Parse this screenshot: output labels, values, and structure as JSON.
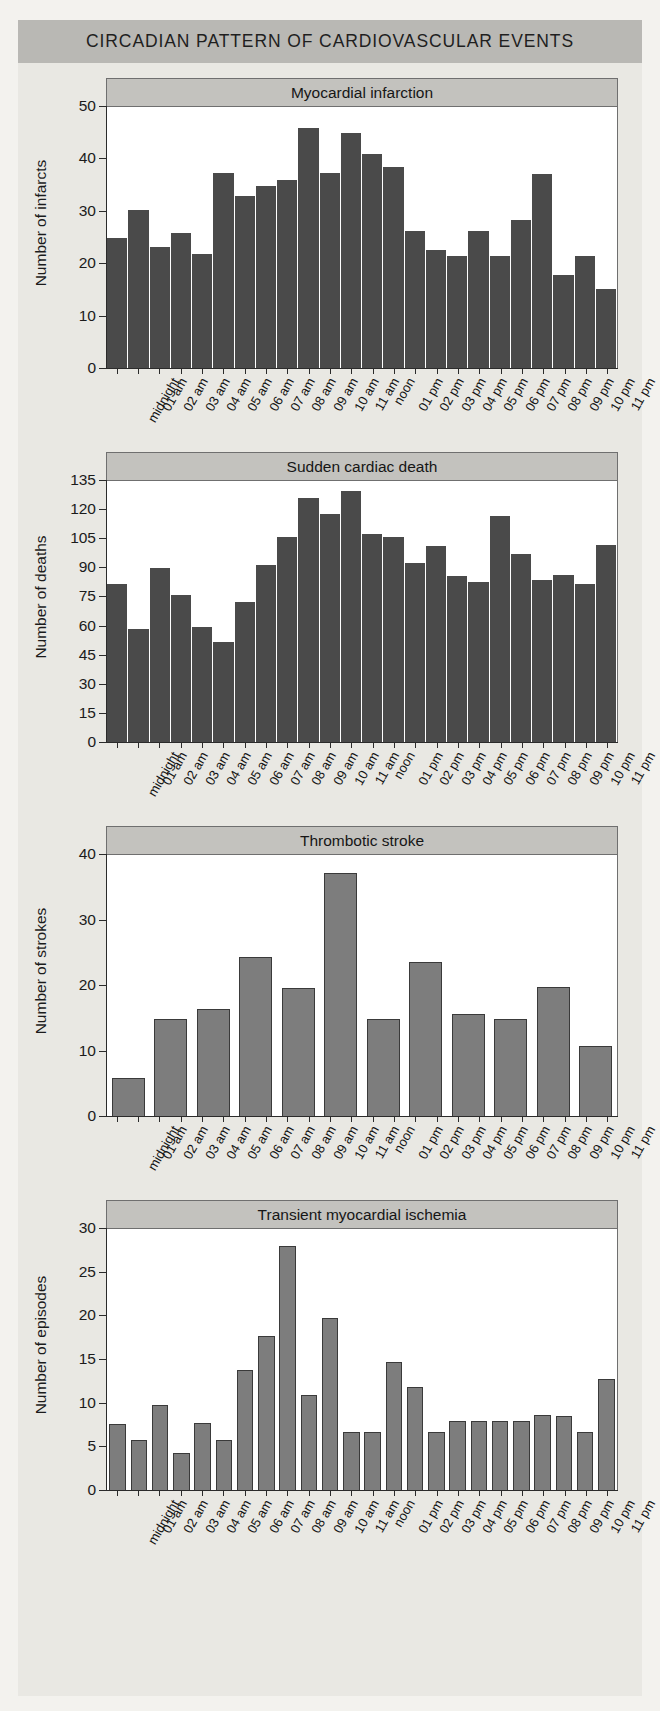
{
  "banner": {
    "title": "CIRCADIAN PATTERN OF CARDIOVASCULAR EVENTS"
  },
  "colors": {
    "banner_bg": "#b9b8b4",
    "caption_bg": "#c3c2be",
    "page_bg": "#e9e8e3",
    "bar_dark": "#4a4a4a",
    "bar_light": "#7d7d7d",
    "axis": "#2b2b2b"
  },
  "hour_labels_24": [
    "midnight",
    "01 am",
    "02 am",
    "03 am",
    "04 am",
    "05 am",
    "06 am",
    "07 am",
    "08 am",
    "09 am",
    "10 am",
    "11 am",
    "noon",
    "01 pm",
    "02 pm",
    "03 pm",
    "04 pm",
    "05 pm",
    "06 pm",
    "07 pm",
    "08 pm",
    "09 pm",
    "10 pm",
    "11 pm"
  ],
  "chart_data": [
    {
      "type": "bar",
      "title": "Myocardial infarction",
      "xlabel": "",
      "ylabel": "Number of infarcts",
      "ylim": [
        0,
        50
      ],
      "yticks": [
        0,
        10,
        20,
        30,
        40,
        50
      ],
      "ytick_labels": [
        "0",
        "10",
        "20",
        "30",
        "40",
        "50"
      ],
      "grid": false,
      "bar_style": "dark",
      "categories": [
        "midnight",
        "01 am",
        "02 am",
        "03 am",
        "04 am",
        "05 am",
        "06 am",
        "07 am",
        "08 am",
        "09 am",
        "10 am",
        "11 am",
        "noon",
        "01 pm",
        "02 pm",
        "03 pm",
        "04 pm",
        "05 pm",
        "06 pm",
        "07 pm",
        "08 pm",
        "09 pm",
        "10 pm",
        "11 pm"
      ],
      "values": [
        25,
        30.3,
        23.3,
        26,
        22,
        37.5,
        33,
        35,
        36,
        46,
        37.5,
        45,
        41,
        38.5,
        26.3,
        22.7,
        21.5,
        26.3,
        21.5,
        28.5,
        37.2,
        18,
        21.5,
        15.2
      ]
    },
    {
      "type": "bar",
      "title": "Sudden cardiac death",
      "xlabel": "",
      "ylabel": "Number of deaths",
      "ylim": [
        0,
        135
      ],
      "yticks": [
        0,
        15,
        30,
        45,
        60,
        75,
        90,
        105,
        120,
        135
      ],
      "ytick_labels": [
        "0",
        "15",
        "30",
        "45",
        "60",
        "75",
        "90",
        "105",
        "120",
        "135"
      ],
      "grid": false,
      "bar_style": "dark",
      "categories": [
        "midnight",
        "01 am",
        "02 am",
        "03 am",
        "04 am",
        "05 am",
        "06 am",
        "07 am",
        "08 am",
        "09 am",
        "10 am",
        "11 am",
        "noon",
        "01 pm",
        "02 pm",
        "03 pm",
        "04 pm",
        "05 pm",
        "06 pm",
        "07 pm",
        "08 pm",
        "09 pm",
        "10 pm",
        "11 pm"
      ],
      "values": [
        82,
        59,
        90,
        76.5,
        60,
        52,
        72.5,
        91.5,
        106,
        126,
        118,
        130,
        107.5,
        106,
        92.5,
        101.5,
        86,
        83,
        117,
        97.5,
        84,
        86.5,
        82,
        102
      ]
    },
    {
      "type": "bar",
      "title": "Thrombotic stroke",
      "xlabel": "",
      "ylabel": "Number of strokes",
      "ylim": [
        0,
        40
      ],
      "yticks": [
        0,
        10,
        20,
        30,
        40
      ],
      "ytick_labels": [
        "0",
        "10",
        "20",
        "30",
        "40"
      ],
      "grid": false,
      "bar_style": "light",
      "bin_hours": 2,
      "categories": [
        "midnight",
        "01 am",
        "02 am",
        "03 am",
        "04 am",
        "05 am",
        "06 am",
        "07 am",
        "08 am",
        "09 am",
        "10 am",
        "11 am",
        "noon",
        "01 pm",
        "02 pm",
        "03 pm",
        "04 pm",
        "05 pm",
        "06 pm",
        "07 pm",
        "08 pm",
        "09 pm",
        "10 pm",
        "11 pm"
      ],
      "bin_labels": [
        "midnight-01 am",
        "02 am-03 am",
        "04 am-05 am",
        "06 am-07 am",
        "08 am-09 am",
        "10 am-11 am",
        "noon-01 pm",
        "02 pm-03 pm",
        "04 pm-05 pm",
        "06 pm-07 pm",
        "08 pm-09 pm",
        "10 pm-11 pm"
      ],
      "values": [
        6,
        15,
        16.5,
        24.5,
        19.7,
        37.2,
        15,
        23.7,
        15.7,
        15,
        19.8,
        10.8
      ]
    },
    {
      "type": "bar",
      "title": "Transient myocardial ischemia",
      "xlabel": "",
      "ylabel": "Number of episodes",
      "ylim": [
        0,
        30
      ],
      "yticks": [
        0,
        5,
        10,
        15,
        20,
        25,
        30
      ],
      "ytick_labels": [
        "0",
        "5",
        "10",
        "15",
        "20",
        "25",
        "30"
      ],
      "grid": false,
      "bar_style": "light",
      "categories": [
        "midnight",
        "01 am",
        "02 am",
        "03 am",
        "04 am",
        "05 am",
        "06 am",
        "07 am",
        "08 am",
        "09 am",
        "10 am",
        "11 am",
        "noon",
        "01 pm",
        "02 pm",
        "03 pm",
        "04 pm",
        "05 pm",
        "06 pm",
        "07 pm",
        "08 pm",
        "09 pm",
        "10 pm",
        "11 pm"
      ],
      "values": [
        7.7,
        5.8,
        9.8,
        4.4,
        7.8,
        5.8,
        13.8,
        17.8,
        28,
        11,
        19.8,
        6.8,
        6.8,
        14.8,
        11.9,
        6.8,
        8,
        8,
        8,
        8,
        8.7,
        8.6,
        6.8,
        12.8
      ]
    }
  ]
}
